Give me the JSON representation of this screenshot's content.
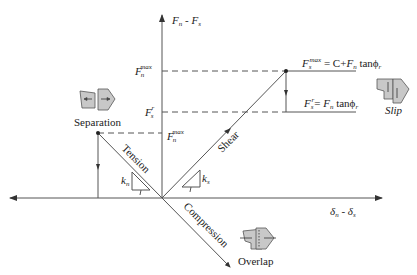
{
  "diagram": {
    "axes": {
      "y_label": {
        "main1": "F",
        "sub1": "n",
        "sep": " - ",
        "main2": "F",
        "sub2": "s"
      },
      "x_label": {
        "main1": "δ",
        "sub1": "n",
        "sep": " - ",
        "main2": "δ",
        "sub2": "s"
      }
    },
    "levels": {
      "fn_max_left": {
        "main": "F",
        "sub": "n",
        "sup": "max"
      },
      "fs_r_left": {
        "main": "F",
        "sub": "s",
        "sup": "r"
      },
      "fn_max_mid": {
        "main": "F",
        "sub": "n",
        "sup": "max"
      }
    },
    "equations": {
      "fs_max": {
        "lhs_main": "F",
        "lhs_sub": "s",
        "lhs_sup": "max",
        "rhs": " = C+",
        "f": "F",
        "f_sub": "n",
        "tan": " tanϕ",
        "tan_sub": "r"
      },
      "fs_r": {
        "lhs_main": "F",
        "lhs_sub": "s",
        "lhs_sup": "r",
        "rhs": "= ",
        "f": "F",
        "f_sub": "n",
        "tan": " tanϕ",
        "tan_sub": "r"
      }
    },
    "line_labels": {
      "tension": "Tension",
      "shear": "Shear",
      "compression": "Compression"
    },
    "stiffness": {
      "kn": {
        "main": "k",
        "sub": "n",
        "run": "1"
      },
      "ks": {
        "main": "k",
        "sub": "s",
        "run": "1"
      }
    },
    "modes": {
      "separation": "Separation",
      "slip": "Slip",
      "overlap": "Overlap"
    },
    "colors": {
      "line": "#555555",
      "text": "#222222",
      "block_fill": "#c8c8c8",
      "block_stroke": "#555555"
    }
  }
}
